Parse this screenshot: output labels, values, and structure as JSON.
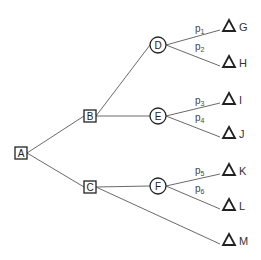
{
  "diagram": {
    "type": "decision-tree",
    "colors": {
      "edge": "#6a6a6a",
      "node_stroke": "#222222",
      "background": "#ffffff"
    },
    "nodes": [
      {
        "id": "A",
        "label": "A",
        "shape": "square",
        "x": 21,
        "y": 153
      },
      {
        "id": "B",
        "label": "B",
        "shape": "square",
        "x": 90,
        "y": 116
      },
      {
        "id": "C",
        "label": "C",
        "shape": "square",
        "x": 90,
        "y": 187
      },
      {
        "id": "D",
        "label": "D",
        "shape": "circle",
        "x": 158,
        "y": 45
      },
      {
        "id": "E",
        "label": "E",
        "shape": "circle",
        "x": 158,
        "y": 116
      },
      {
        "id": "F",
        "label": "F",
        "shape": "circle",
        "x": 158,
        "y": 186
      },
      {
        "id": "G",
        "label": "G",
        "shape": "triangle",
        "x": 229,
        "y": 26
      },
      {
        "id": "H",
        "label": "H",
        "shape": "triangle",
        "x": 229,
        "y": 62
      },
      {
        "id": "I",
        "label": "I",
        "shape": "triangle",
        "x": 229,
        "y": 99
      },
      {
        "id": "J",
        "label": "J",
        "shape": "triangle",
        "x": 229,
        "y": 133
      },
      {
        "id": "K",
        "label": "K",
        "shape": "triangle",
        "x": 229,
        "y": 170
      },
      {
        "id": "L",
        "label": "L",
        "shape": "triangle",
        "x": 229,
        "y": 205
      },
      {
        "id": "M",
        "label": "M",
        "shape": "triangle",
        "x": 229,
        "y": 240
      }
    ],
    "edges": [
      {
        "from": "A",
        "to": "B"
      },
      {
        "from": "A",
        "to": "C"
      },
      {
        "from": "B",
        "to": "D"
      },
      {
        "from": "B",
        "to": "E"
      },
      {
        "from": "C",
        "to": "F"
      },
      {
        "from": "C",
        "to": "M"
      },
      {
        "from": "D",
        "to": "G",
        "prob": "p",
        "sub": "1"
      },
      {
        "from": "D",
        "to": "H",
        "prob": "p",
        "sub": "2"
      },
      {
        "from": "E",
        "to": "I",
        "prob": "p",
        "sub": "3"
      },
      {
        "from": "E",
        "to": "J",
        "prob": "p",
        "sub": "4"
      },
      {
        "from": "F",
        "to": "K",
        "prob": "p",
        "sub": "5"
      },
      {
        "from": "F",
        "to": "L",
        "prob": "p",
        "sub": "6"
      }
    ]
  }
}
